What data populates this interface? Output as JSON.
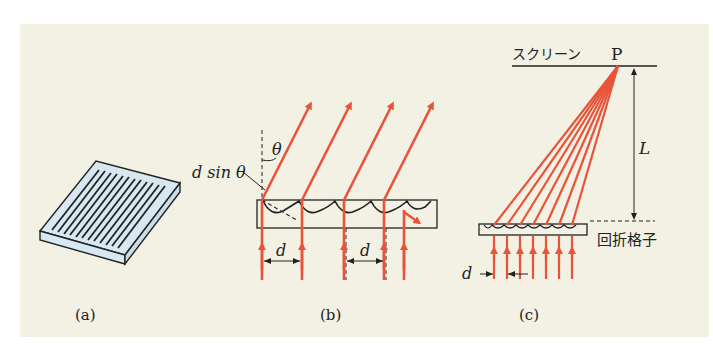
{
  "figure": {
    "background_color": "#f3f1e3",
    "ray_color": "#e8543a",
    "grating_fill": "#d7e8f2",
    "line_color": "#222222",
    "panels": [
      {
        "id": "a",
        "caption": "(a)",
        "description": "diffraction grating plate with parallel grooves"
      },
      {
        "id": "b",
        "caption": "(b)",
        "labels": {
          "theta": "θ",
          "path_difference": "d sin θ",
          "spacing_1": "d",
          "spacing_2": "d"
        }
      },
      {
        "id": "c",
        "caption": "(c)",
        "labels": {
          "screen": "スクリーン",
          "point": "P",
          "distance": "L",
          "grating": "回折格子",
          "spacing": "d"
        }
      }
    ]
  }
}
